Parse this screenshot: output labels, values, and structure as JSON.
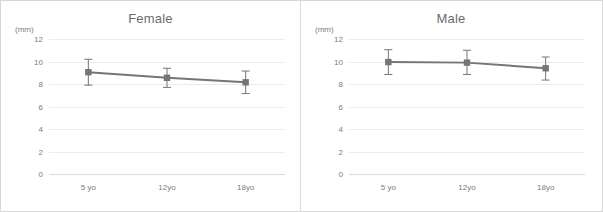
{
  "chart_data": [
    {
      "type": "line",
      "title": "Female",
      "xlabel": "",
      "ylabel": "(mm)",
      "unit_label": "(mm)",
      "categories": [
        "5 yo",
        "12yo",
        "18yo"
      ],
      "values": [
        9.05,
        8.55,
        8.15
      ],
      "error_bars": {
        "upper": [
          10.2,
          9.4,
          9.15
        ],
        "lower": [
          7.9,
          7.7,
          7.15
        ]
      },
      "yticks": [
        0,
        2,
        4,
        6,
        8,
        10,
        12
      ],
      "ylim": [
        0,
        12
      ],
      "grid": true,
      "legend": "none",
      "series_color": "#757575",
      "marker": "square"
    },
    {
      "type": "line",
      "title": "Male",
      "xlabel": "",
      "ylabel": "(mm)",
      "unit_label": "(mm)",
      "categories": [
        "5 yo",
        "12yo",
        "18yo"
      ],
      "values": [
        9.95,
        9.9,
        9.4
      ],
      "error_bars": {
        "upper": [
          11.05,
          11.0,
          10.4
        ],
        "lower": [
          8.85,
          8.85,
          8.35
        ]
      },
      "yticks": [
        0,
        2,
        4,
        6,
        8,
        10,
        12
      ],
      "ylim": [
        0,
        12
      ],
      "grid": true,
      "legend": "none",
      "series_color": "#757575",
      "marker": "square"
    }
  ],
  "colors": {
    "series": "#757575",
    "gridline": "#ebebeb",
    "axis": "#dcdcdc",
    "text": "#7d7d7d",
    "title_text": "#6b6b6b",
    "frame": "#d7d7d7",
    "divider": "#d9d9d9",
    "background": "#ffffff"
  }
}
